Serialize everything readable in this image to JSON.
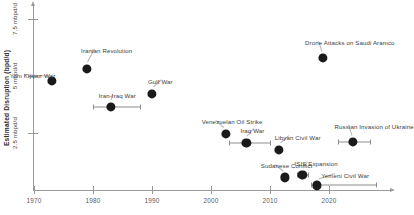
{
  "chart_data": {
    "type": "scatter",
    "title": "",
    "xlabel": "",
    "ylabel": "Estimated Disruption (bpd/d)",
    "xlim": [
      1968,
      2029
    ],
    "ylim": [
      0,
      8.3
    ],
    "grid": false,
    "legend": null,
    "x_ticks": [
      1970,
      1980,
      1990,
      2000,
      2010,
      2020
    ],
    "x_tick_labels": [
      "1970",
      "1980",
      "1990",
      "2000",
      "2010",
      "2020"
    ],
    "y_ticks": [
      2.5,
      5,
      7.5
    ],
    "y_tick_labels": [
      "2.5 mbpd/d",
      "5 mbpd/d",
      "7.5 mbpd/d"
    ],
    "points": [
      {
        "label": "Yom Kippur War",
        "x": 1973,
        "y": 4.8,
        "err_low": null,
        "err_high": null,
        "label_dx": -42,
        "label_dy": -9
      },
      {
        "label": "Iranian Revolution",
        "x": 1979,
        "y": 5.3,
        "err_low": null,
        "err_high": null,
        "label_dx": -6,
        "label_dy": -22
      },
      {
        "label": "Iran-Iraq War",
        "x": 1983,
        "y": 3.65,
        "err_low": 1980,
        "err_high": 1988,
        "label_dx": -12,
        "label_dy": -15
      },
      {
        "label": "Gulf War",
        "x": 1990,
        "y": 4.2,
        "err_low": null,
        "err_high": null,
        "label_dx": -4,
        "label_dy": -16
      },
      {
        "label": "Venezuelan Oil Strike",
        "x": 2002.5,
        "y": 2.45,
        "err_low": null,
        "err_high": null,
        "label_dx": -24,
        "label_dy": -16
      },
      {
        "label": "Iraq War",
        "x": 2006,
        "y": 2.05,
        "err_low": 2003,
        "err_high": 2010,
        "label_dx": -6,
        "label_dy": -16
      },
      {
        "label": "Libyan Civil War",
        "x": 2011.5,
        "y": 1.75,
        "err_low": null,
        "err_high": null,
        "label_dx": -4,
        "label_dy": -16
      },
      {
        "label": "Drone Attacks on Saudi Aramco",
        "x": 2019,
        "y": 5.8,
        "err_low": null,
        "err_high": null,
        "label_dx": -18,
        "label_dy": -19
      },
      {
        "label": "Russian Invasion of Ukraine",
        "x": 2024,
        "y": 2.1,
        "err_low": 2021.5,
        "err_high": 2027,
        "label_dx": -18,
        "label_dy": -19
      },
      {
        "label": "Sudanese Conflict",
        "x": 2012.5,
        "y": 0.55,
        "err_low": null,
        "err_high": null,
        "label_dx": -24,
        "label_dy": -15
      },
      {
        "label": "ISIS Expansion",
        "x": 2015.5,
        "y": 0.65,
        "err_low": 2014.5,
        "err_high": 2016.5,
        "label_dx": -8,
        "label_dy": -15
      },
      {
        "label": "Yemeni Civil War",
        "x": 2018,
        "y": 0.2,
        "err_low": 2017,
        "err_high": 2028,
        "label_dx": 4,
        "label_dy": -13
      }
    ]
  },
  "axes": {
    "y_title": "Estimated Disruption (bpd/d)"
  },
  "colors": {
    "point": "#1a1a1a",
    "axis": "#9a9a9a",
    "label_text": "#3d3d3d",
    "background": "#ffffff"
  }
}
